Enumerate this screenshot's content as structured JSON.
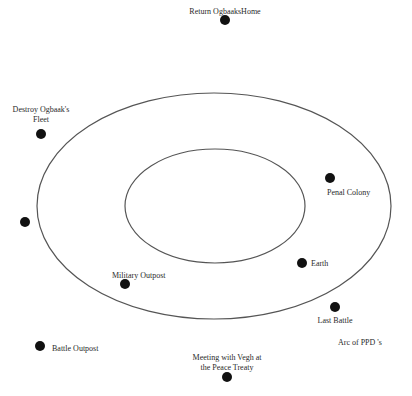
{
  "diagram": {
    "title": "Arc of PPD 's",
    "colors": {
      "stroke": "#555555",
      "dot": "#111111",
      "text": "#2a2a2a",
      "background": "#ffffff"
    },
    "orbits": [
      {
        "name": "outer-orbit",
        "cx": 214,
        "cy": 206,
        "rx": 177,
        "ry": 113
      },
      {
        "name": "inner-orbit",
        "cx": 215,
        "cy": 206,
        "rx": 90,
        "ry": 57
      }
    ],
    "nodes": [
      {
        "id": "return-ogbaaks-home",
        "label": "Return OgbaaksHome",
        "dot": [
          225,
          20
        ],
        "text": [
          225,
          7
        ],
        "align": "center"
      },
      {
        "id": "destroy-ogbaaks-fleet",
        "label_lines": [
          "Destroy Ogbaak's",
          "Fleet"
        ],
        "dot": [
          41,
          134
        ],
        "text": [
          41,
          105
        ],
        "align": "center"
      },
      {
        "id": "penal-colony",
        "label": "Penal Colony",
        "dot": [
          330,
          178
        ],
        "text": [
          327,
          188
        ],
        "align": "left"
      },
      {
        "id": "unnamed-node",
        "label": "",
        "dot": [
          25,
          222
        ]
      },
      {
        "id": "earth",
        "label": "Earth",
        "dot": [
          302,
          263
        ],
        "text": [
          311,
          259
        ],
        "align": "left"
      },
      {
        "id": "military-outpost",
        "label": "Military Outpost",
        "dot": [
          125,
          284
        ],
        "text": [
          112,
          271
        ],
        "align": "left"
      },
      {
        "id": "last-battle",
        "label": "Last Battle",
        "dot": [
          335,
          307
        ],
        "text": [
          335,
          316
        ],
        "align": "center"
      },
      {
        "id": "battle-outpost",
        "label": "Battle Outpost",
        "dot": [
          40,
          346
        ],
        "text": [
          52,
          344
        ],
        "align": "left"
      },
      {
        "id": "meeting-vegh",
        "label_lines": [
          "Meeting with Vegh at",
          "the Peace Treaty"
        ],
        "dot": [
          227,
          377
        ],
        "text": [
          227,
          353
        ],
        "align": "center"
      }
    ],
    "caption": {
      "text": "Arc of PPD 's",
      "x": 338,
      "y": 338
    }
  }
}
